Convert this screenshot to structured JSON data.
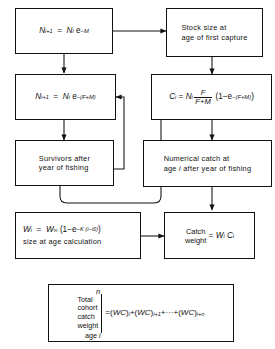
{
  "diagram": {
    "line_color": "#111111",
    "background": "#ffffff",
    "nodes": [
      {
        "id": "natural-mortality",
        "kind": "formula",
        "text": "N(i+1) = N(i) e^-M",
        "parts": {
          "lhs_base": "N",
          "lhs_sub": "i+1",
          "eq": "=",
          "rhs_base": "N",
          "rhs_sub": "i",
          "exp_base": "e",
          "exp_sup": "-M"
        }
      },
      {
        "id": "stock-size",
        "kind": "text",
        "line1": "Stock size at",
        "line2": "age of first capture"
      },
      {
        "id": "total-mortality",
        "kind": "formula",
        "text": "N(i+1) = N(i) e^-(F+M)",
        "parts": {
          "lhs_base": "N",
          "lhs_sub": "i+1",
          "eq": "=",
          "rhs_base": "N",
          "rhs_sub": "i",
          "exp_base": "e",
          "exp_sup": "-(F+M)"
        }
      },
      {
        "id": "catch-equation",
        "kind": "formula",
        "text": "C(i) = N(i) F/(F+M) (1 - e^-(F+M))",
        "parts": {
          "lhs_base": "C",
          "lhs_sub": "i",
          "eq": "=",
          "rhs_base": "N",
          "rhs_sub": "i",
          "frac_num": "F",
          "frac_den": "F+M",
          "paren_open": "(1",
          "minus": "−",
          "exp_base": "e",
          "exp_sup": "-(F+M)",
          "paren_close": ")"
        }
      },
      {
        "id": "survivors",
        "kind": "text",
        "line1": "Survivors after",
        "line2": "year of fishing"
      },
      {
        "id": "numerical-catch",
        "kind": "text",
        "line1": "Numerical catch at",
        "line2": "age i after year of fishing"
      },
      {
        "id": "size-at-age",
        "kind": "formula-caption",
        "text": "W(i) = W(inf) (1 - e^-K(i - t0))",
        "caption": "size at age calculation",
        "parts": {
          "lhs_base": "W",
          "lhs_sub": "i",
          "eq": "=",
          "rhs_base": "W",
          "rhs_sub": "∞",
          "paren_open": "(1",
          "minus": "−",
          "exp_base": "e",
          "exp_sup": "-K (i - t0)",
          "paren_close": ")"
        }
      },
      {
        "id": "catch-weight",
        "kind": "labelled-formula",
        "label_top": "Catch",
        "label_bottom": "weight",
        "eq": "=",
        "rhs": "W(i) C(i)",
        "parts": {
          "w_base": "W",
          "w_sub": "i",
          "c_base": "C",
          "c_sub": "i"
        }
      },
      {
        "id": "total-cohort",
        "kind": "summation",
        "label_lines": [
          "Total",
          "cohort",
          "catch",
          "weight"
        ],
        "limit_top": "n",
        "limit_bottom": "age i",
        "rhs": "= (WC)i + (WC)i+1 + ··· + (WC)i+n",
        "parts": {
          "eq": "=",
          "t1_base": "(WC)",
          "t1_sub": "i",
          "plus": "+",
          "t2_base": "(WC)",
          "t2_sub": "i+1",
          "dots": "···",
          "t3_base": "(WC)",
          "t3_sub": "i+n"
        }
      }
    ]
  }
}
